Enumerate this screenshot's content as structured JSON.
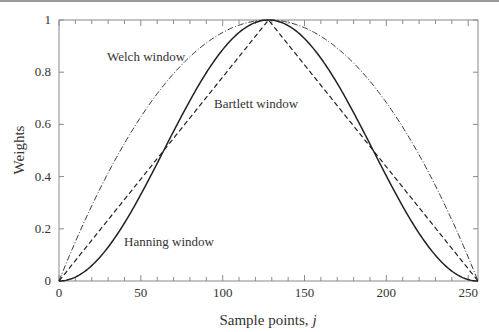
{
  "chart_data": {
    "type": "line",
    "title": "",
    "xlabel": "Sample points, j",
    "xlabel_main": "Sample points, ",
    "xlabel_var": "j",
    "ylabel": "Weights",
    "xlim": [
      0,
      256
    ],
    "ylim": [
      0,
      1
    ],
    "grid": false,
    "legend": "none (inline curve labels)",
    "x_ticks": [
      0,
      50,
      100,
      150,
      200,
      250
    ],
    "x_tick_labels": [
      "0",
      "50",
      "100",
      "150",
      "200",
      "250"
    ],
    "x_minor_step": 10,
    "y_ticks": [
      0,
      0.2,
      0.4,
      0.6,
      0.8,
      1
    ],
    "y_tick_labels": [
      "0",
      "0.2",
      "0.4",
      "0.6",
      "0.8",
      "1"
    ],
    "N": 256,
    "series": [
      {
        "name": "Welch window",
        "style": "dash-dot",
        "formula": "1 - ((j - N/2)/(N/2))^2",
        "x": [
          0,
          32,
          64,
          96,
          128,
          160,
          192,
          224,
          256
        ],
        "values": [
          0,
          0.4375,
          0.75,
          0.9375,
          1,
          0.9375,
          0.75,
          0.4375,
          0
        ]
      },
      {
        "name": "Bartlett window",
        "style": "dashed",
        "formula": "1 - |j - N/2|/(N/2)",
        "x": [
          0,
          32,
          64,
          96,
          128,
          160,
          192,
          224,
          256
        ],
        "values": [
          0,
          0.25,
          0.5,
          0.75,
          1,
          0.75,
          0.5,
          0.25,
          0
        ]
      },
      {
        "name": "Hanning window",
        "style": "solid",
        "formula": "0.5*(1 - cos(2*pi*j/N))",
        "x": [
          0,
          32,
          64,
          96,
          128,
          160,
          192,
          224,
          256
        ],
        "values": [
          0,
          0.1464,
          0.5,
          0.8536,
          1,
          0.8536,
          0.5,
          0.1464,
          0
        ]
      }
    ],
    "annotations": [
      {
        "text": "Welch window",
        "x": 40,
        "y": 0.87
      },
      {
        "text": "Bartlett window",
        "x": 95,
        "y": 0.67
      },
      {
        "text": "Hanning window",
        "x": 40,
        "y": 0.1
      }
    ]
  },
  "colors": {
    "axis": "#8a8a8a",
    "curve": "#222222",
    "text": "#333333"
  }
}
